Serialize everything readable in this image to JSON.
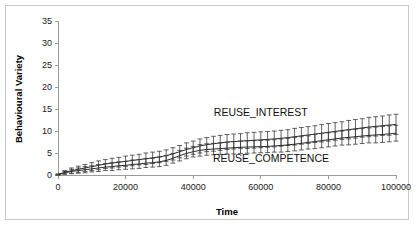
{
  "chart_data": {
    "type": "line",
    "title": "",
    "xlabel": "Time",
    "ylabel": "Behavioural Variety",
    "xlim": [
      0,
      100000
    ],
    "ylim": [
      0,
      35
    ],
    "xticks": [
      0,
      20000,
      40000,
      60000,
      80000,
      100000
    ],
    "xtick_labels": [
      "0",
      "20000",
      "40000",
      "60000",
      "80000",
      "100000"
    ],
    "yticks": [
      0,
      5,
      10,
      15,
      20,
      25,
      30,
      35
    ],
    "ytick_labels": [
      "0",
      "5",
      "10",
      "15",
      "20",
      "25",
      "30",
      "35"
    ],
    "grid": false,
    "legend_position": "inline-annotation",
    "error_bars": true,
    "x": [
      0,
      2000,
      4000,
      6000,
      8000,
      10000,
      12000,
      14000,
      16000,
      18000,
      20000,
      22000,
      24000,
      26000,
      28000,
      30000,
      32000,
      34000,
      36000,
      38000,
      40000,
      42000,
      44000,
      46000,
      48000,
      50000,
      52000,
      54000,
      56000,
      58000,
      60000,
      62000,
      64000,
      66000,
      68000,
      70000,
      72000,
      74000,
      76000,
      78000,
      80000,
      82000,
      84000,
      86000,
      88000,
      90000,
      92000,
      94000,
      96000,
      98000,
      100000
    ],
    "series": [
      {
        "name": "REUSE_INTEREST",
        "label": "REUSE_INTEREST",
        "color": "#2b2b2b",
        "values": [
          0.1,
          0.6,
          1.0,
          1.3,
          1.6,
          1.9,
          2.2,
          2.5,
          2.7,
          2.9,
          3.1,
          3.3,
          3.5,
          3.7,
          3.9,
          4.1,
          4.4,
          4.8,
          5.3,
          5.8,
          6.2,
          6.6,
          6.9,
          7.1,
          7.3,
          7.5,
          7.6,
          7.7,
          7.8,
          7.9,
          8.0,
          8.1,
          8.2,
          8.35,
          8.5,
          8.7,
          8.9,
          9.1,
          9.3,
          9.5,
          9.7,
          9.9,
          10.1,
          10.3,
          10.5,
          10.7,
          10.9,
          11.05,
          11.2,
          11.35,
          11.5
        ],
        "err_lower": [
          0.1,
          0.4,
          0.6,
          0.7,
          0.8,
          0.9,
          1.0,
          1.0,
          1.1,
          1.1,
          1.2,
          1.2,
          1.2,
          1.3,
          1.3,
          1.3,
          1.3,
          1.4,
          1.4,
          1.5,
          1.5,
          1.6,
          1.6,
          1.7,
          1.7,
          1.7,
          1.7,
          1.7,
          1.8,
          1.8,
          1.8,
          1.8,
          1.8,
          1.8,
          1.8,
          1.9,
          1.9,
          1.9,
          1.9,
          2.0,
          2.0,
          2.0,
          2.0,
          2.1,
          2.1,
          2.1,
          2.2,
          2.2,
          2.2,
          2.3,
          2.3
        ],
        "err_upper": [
          0.1,
          0.4,
          0.6,
          0.7,
          0.8,
          0.9,
          1.0,
          1.0,
          1.1,
          1.1,
          1.2,
          1.2,
          1.2,
          1.3,
          1.3,
          1.3,
          1.3,
          1.4,
          1.4,
          1.5,
          1.5,
          1.6,
          1.6,
          1.7,
          1.7,
          1.7,
          1.7,
          1.7,
          1.8,
          1.8,
          1.8,
          1.8,
          1.8,
          1.8,
          1.8,
          1.9,
          1.9,
          1.9,
          1.9,
          2.0,
          2.0,
          2.0,
          2.0,
          2.1,
          2.1,
          2.1,
          2.2,
          2.2,
          2.2,
          2.3,
          2.3
        ]
      },
      {
        "name": "REUSE_COMPETENCE",
        "label": "REUSE_COMPETENCE",
        "color": "#2b2b2b",
        "values": [
          0.1,
          0.5,
          0.8,
          1.0,
          1.2,
          1.4,
          1.6,
          1.8,
          1.9,
          2.1,
          2.2,
          2.4,
          2.5,
          2.7,
          2.8,
          3.0,
          3.3,
          3.8,
          4.4,
          4.9,
          5.3,
          5.6,
          5.8,
          5.9,
          6.0,
          6.1,
          6.2,
          6.3,
          6.35,
          6.4,
          6.45,
          6.5,
          6.6,
          6.7,
          6.85,
          7.0,
          7.2,
          7.4,
          7.6,
          7.8,
          8.0,
          8.2,
          8.4,
          8.55,
          8.7,
          8.85,
          9.0,
          9.1,
          9.2,
          9.35,
          9.5
        ],
        "err_lower": [
          0.1,
          0.3,
          0.5,
          0.6,
          0.7,
          0.7,
          0.8,
          0.8,
          0.9,
          0.9,
          0.9,
          1.0,
          1.0,
          1.0,
          1.0,
          1.1,
          1.1,
          1.1,
          1.2,
          1.2,
          1.2,
          1.3,
          1.3,
          1.3,
          1.3,
          1.3,
          1.4,
          1.4,
          1.4,
          1.4,
          1.4,
          1.4,
          1.4,
          1.5,
          1.5,
          1.5,
          1.5,
          1.5,
          1.6,
          1.6,
          1.6,
          1.6,
          1.6,
          1.7,
          1.7,
          1.7,
          1.7,
          1.8,
          1.8,
          1.8,
          1.8
        ],
        "err_upper": [
          0.1,
          0.3,
          0.5,
          0.6,
          0.7,
          0.7,
          0.8,
          0.8,
          0.9,
          0.9,
          0.9,
          1.0,
          1.0,
          1.0,
          1.0,
          1.1,
          1.1,
          1.1,
          1.2,
          1.2,
          1.2,
          1.3,
          1.3,
          1.3,
          1.3,
          1.3,
          1.4,
          1.4,
          1.4,
          1.4,
          1.4,
          1.4,
          1.4,
          1.5,
          1.5,
          1.5,
          1.5,
          1.5,
          1.6,
          1.6,
          1.6,
          1.6,
          1.6,
          1.7,
          1.7,
          1.7,
          1.7,
          1.8,
          1.8,
          1.8,
          1.8
        ]
      }
    ],
    "annotations": [
      {
        "text": "REUSE_INTEREST",
        "x": 60000,
        "y": 13.3
      },
      {
        "text": "REUSE_COMPETENCE",
        "x": 63000,
        "y": 2.9
      }
    ]
  }
}
